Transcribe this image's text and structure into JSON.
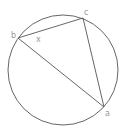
{
  "diagram": {
    "type": "inscribed-triangle",
    "circle": {
      "cx": 63,
      "cy": 70,
      "r": 55,
      "stroke": "#555555"
    },
    "vertices": [
      {
        "id": "b",
        "label": "b",
        "x": 18,
        "y": 38,
        "lx": 11,
        "ly": 38
      },
      {
        "id": "c",
        "label": "c",
        "x": 83,
        "y": 18,
        "lx": 84,
        "ly": 15
      },
      {
        "id": "a",
        "label": "a",
        "x": 104,
        "y": 107,
        "lx": 105,
        "ly": 116
      }
    ],
    "angle_marker": {
      "label": "x",
      "x": 37,
      "y": 42
    },
    "line_color": "#555555",
    "label_color": "#9a9a9a"
  }
}
